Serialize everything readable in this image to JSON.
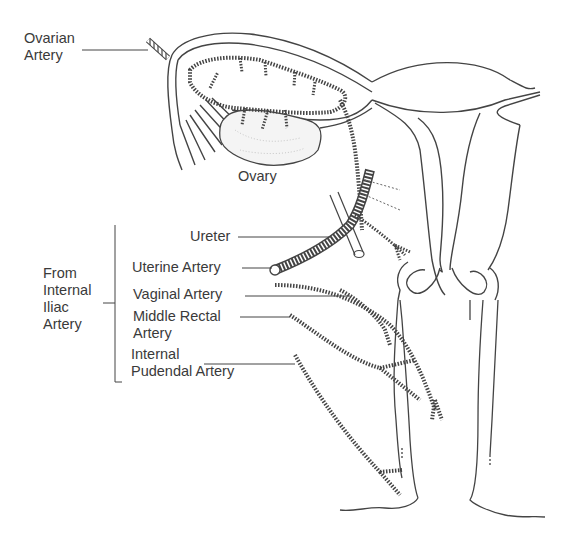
{
  "diagram": {
    "type": "anatomical illustration",
    "colors": {
      "line": "#3a3a3a",
      "text": "#3a3a3a",
      "background": "#ffffff"
    }
  },
  "labels": {
    "ovarian_artery": [
      "Ovarian",
      "Artery"
    ],
    "ovary": "Ovary",
    "ureter": "Ureter",
    "uterine_artery": "Uterine Artery",
    "vaginal_artery": "Vaginal Artery",
    "middle_rectal_artery": [
      "Middle Rectal",
      "Artery"
    ],
    "internal_pudendal_artery": [
      "Internal",
      "Pudendal Artery"
    ],
    "group_label": [
      "From",
      "Internal",
      "Iliac",
      "Artery"
    ]
  }
}
